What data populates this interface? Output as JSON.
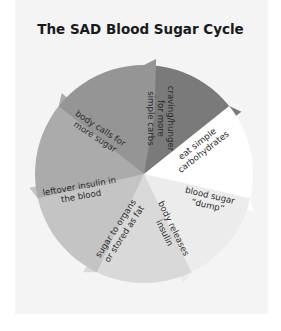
{
  "title": "The SAD Blood Sugar Cycle",
  "diagram": {
    "type": "cycle",
    "center": [
      144,
      174
    ],
    "radius": 109,
    "segments": [
      {
        "label_lines": [
          "craving/hunger",
          "for more",
          "simple carbs"
        ],
        "color": "#7a7a7a"
      },
      {
        "label_lines": [
          "eat simple",
          "carbohydrates"
        ],
        "color": "#ffffff"
      },
      {
        "label_lines": [
          "blood sugar",
          "“dump”"
        ],
        "color": "#ececec"
      },
      {
        "label_lines": [
          "body releases",
          "insulin"
        ],
        "color": "#d9d9d9"
      },
      {
        "label_lines": [
          "sugar to organs",
          "or stored as fat"
        ],
        "color": "#c4c4c4"
      },
      {
        "label_lines": [
          "leftover insulin in",
          "the blood"
        ],
        "color": "#ababab"
      },
      {
        "label_lines": [
          "body calls for",
          "more sugar"
        ],
        "color": "#959595"
      }
    ]
  },
  "colors": {
    "background": "#ffffff",
    "card": "#f4f4f4",
    "text": "#2a2a2a"
  }
}
